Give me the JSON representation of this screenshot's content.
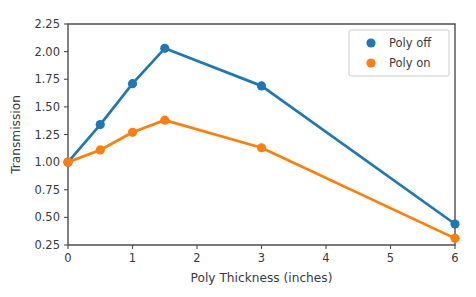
{
  "chart_data": {
    "type": "line",
    "title": "",
    "xlabel": "Poly Thickness (inches)",
    "ylabel": "Transmission",
    "xlim": [
      0,
      6
    ],
    "ylim": [
      0.25,
      2.25
    ],
    "xticks": [
      "0",
      "1",
      "2",
      "3",
      "4",
      "5",
      "6"
    ],
    "xtick_values": [
      0,
      1,
      2,
      3,
      4,
      5,
      6
    ],
    "yticks": [
      "0.25",
      "0.50",
      "0.75",
      "1.00",
      "1.25",
      "1.50",
      "1.75",
      "2.00",
      "2.25"
    ],
    "ytick_values": [
      0.25,
      0.5,
      0.75,
      1.0,
      1.25,
      1.5,
      1.75,
      2.0,
      2.25
    ],
    "grid": false,
    "legend_position": "upper right",
    "x": [
      0,
      0.5,
      1,
      1.5,
      3,
      6
    ],
    "series": [
      {
        "name": "Poly off",
        "color": "#1f77b4",
        "values": [
          1.0,
          1.34,
          1.71,
          2.03,
          1.69,
          0.44
        ]
      },
      {
        "name": "Poly on",
        "color": "#ff7f0e",
        "values": [
          1.0,
          1.11,
          1.27,
          1.38,
          1.13,
          0.31
        ]
      }
    ]
  },
  "legend": {
    "entries": [
      {
        "label": "Poly off",
        "color": "#1f77b4"
      },
      {
        "label": "Poly on",
        "color": "#ff7f0e"
      }
    ]
  }
}
